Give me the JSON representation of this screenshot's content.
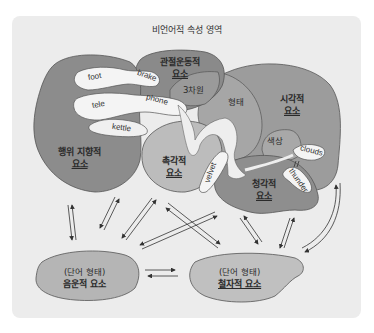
{
  "diagram": {
    "title": "비언어적 속성 영역",
    "regions": {
      "action": {
        "line1": "행위 지향적",
        "line2": "요소"
      },
      "articulatory": {
        "line1": "관절운동적",
        "line2": "요소"
      },
      "visual": {
        "line1": "시각적",
        "line2": "요소"
      },
      "tactile": {
        "line1": "촉각적",
        "line2": "요소"
      },
      "auditory": {
        "line1": "청각적",
        "line2": "요소"
      },
      "phonological": {
        "line1": "(단어 형태)",
        "line2": "음운적 요소"
      },
      "orthographic": {
        "line1": "(단어 형태)",
        "line2": "철자적 요소"
      }
    },
    "subregions": {
      "three_d": "3차원",
      "shape": "형태",
      "color": "색상"
    },
    "words": {
      "foot": "foot",
      "brake": "brake",
      "tele": "tele",
      "phone": "phone",
      "kettle": "kettle",
      "velvet": "velvet",
      "clouds": "clouds",
      "thunder": "thunder"
    },
    "colors": {
      "background": "#ececec",
      "dark_region": "#8f8f8f",
      "mid_region": "#a6a6a6",
      "light_region": "#c2c2c2",
      "word_blob": "#f4f4f4",
      "outline": "#555555"
    }
  }
}
